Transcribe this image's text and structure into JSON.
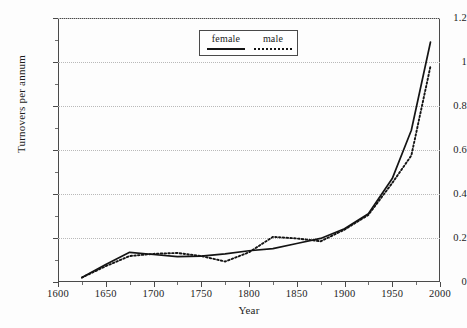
{
  "chart_data": {
    "type": "line",
    "title": "",
    "xlabel": "Year",
    "ylabel": "Turnovers per annum",
    "xlim": [
      1600,
      2000
    ],
    "ylim": [
      0,
      1.2
    ],
    "xticks": [
      1600,
      1650,
      1700,
      1750,
      1800,
      1850,
      1900,
      1950,
      2000
    ],
    "xticklabels": [
      "1600",
      "1650",
      "1700",
      "1750",
      "1800",
      "1850",
      "1900",
      "1950",
      "2000"
    ],
    "yticks": [
      0,
      0.2,
      0.4,
      0.6,
      0.8,
      1,
      1.2
    ],
    "yticklabels": [
      "0",
      "0.2",
      "0.4",
      "0.6",
      "0.8",
      "1",
      "1.2"
    ],
    "y_minor_ticks": [
      0.1,
      0.3,
      0.5,
      0.7,
      0.9,
      1.1
    ],
    "x_minor_ticks": [
      1625,
      1675,
      1725,
      1775,
      1825,
      1875,
      1925,
      1975
    ],
    "grid": "horizontal-dotted",
    "legend_position": "top-center",
    "series": [
      {
        "name": "female",
        "style": "solid",
        "color": "#141414",
        "x": [
          1625,
          1650,
          1675,
          1700,
          1725,
          1750,
          1775,
          1800,
          1825,
          1850,
          1875,
          1900,
          1925,
          1950,
          1970,
          1990
        ],
        "values": [
          0.02,
          0.08,
          0.135,
          0.125,
          0.115,
          0.118,
          0.128,
          0.142,
          0.152,
          0.175,
          0.198,
          0.242,
          0.31,
          0.47,
          0.69,
          1.09
        ]
      },
      {
        "name": "male",
        "style": "dotted",
        "color": "#141414",
        "x": [
          1625,
          1650,
          1675,
          1700,
          1725,
          1750,
          1775,
          1800,
          1825,
          1850,
          1875,
          1900,
          1925,
          1950,
          1970,
          1990
        ],
        "values": [
          0.02,
          0.072,
          0.118,
          0.128,
          0.132,
          0.118,
          0.093,
          0.135,
          0.205,
          0.198,
          0.185,
          0.238,
          0.305,
          0.45,
          0.575,
          0.98
        ]
      }
    ]
  },
  "legend": {
    "female_label": "female",
    "male_label": "male"
  },
  "axes": {
    "x_title": "Year",
    "y_title": "Turnovers per annum"
  }
}
